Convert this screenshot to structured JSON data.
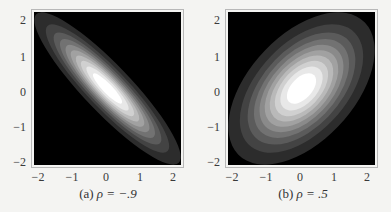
{
  "chart_data": [
    {
      "type": "heatmap",
      "subtype": "filled-contour",
      "title": "",
      "caption": "(a) ρ = −.9",
      "caption_label": "(a)",
      "caption_expr": "ρ = −.9",
      "distribution": "bivariate standard normal",
      "rho": -0.9,
      "xlabel": "",
      "ylabel": "",
      "xlim": [
        -2.2,
        2.2
      ],
      "ylim": [
        -2.2,
        2.2
      ],
      "xticks": [
        -2,
        -1,
        0,
        1,
        2
      ],
      "yticks": [
        -2,
        -1,
        0,
        1,
        2
      ],
      "xtick_labels": [
        "−2",
        "−1",
        "0",
        "1",
        "2"
      ],
      "ytick_labels": [
        "2",
        "1",
        "0",
        "−1",
        "−2"
      ],
      "contour_levels": 10,
      "colormap": "grayscale (black = low density, white = peak)",
      "grid": false,
      "legend": "none"
    },
    {
      "type": "heatmap",
      "subtype": "filled-contour",
      "title": "",
      "caption": "(b) ρ = .5",
      "caption_label": "(b)",
      "caption_expr": "ρ = .5",
      "distribution": "bivariate standard normal",
      "rho": 0.5,
      "xlabel": "",
      "ylabel": "",
      "xlim": [
        -2.2,
        2.2
      ],
      "ylim": [
        -2.2,
        2.2
      ],
      "xticks": [
        -2,
        -1,
        0,
        1,
        2
      ],
      "yticks": [
        -2,
        -1,
        0,
        1,
        2
      ],
      "xtick_labels": [
        "−2",
        "−1",
        "0",
        "1",
        "2"
      ],
      "ytick_labels": [
        "2",
        "1",
        "0",
        "−1",
        "−2"
      ],
      "contour_levels": 10,
      "colormap": "grayscale (black = low density, white = peak)",
      "grid": false,
      "legend": "none"
    }
  ],
  "panels": [
    {
      "caption_label": "(a)",
      "caption_expr": "ρ = −.9",
      "rho": -0.9,
      "xtick_labels": [
        "−2",
        "−1",
        "0",
        "1",
        "2"
      ],
      "ytick_labels": [
        "2",
        "1",
        "0",
        "−1",
        "−2"
      ]
    },
    {
      "caption_label": "(b)",
      "caption_expr": "ρ = .5",
      "rho": 0.5,
      "xtick_labels": [
        "−2",
        "−1",
        "0",
        "1",
        "2"
      ],
      "ytick_labels": [
        "2",
        "1",
        "0",
        "−1",
        "−2"
      ]
    }
  ],
  "colors": {
    "background": "#f4f4f2",
    "plot_background": "#000000",
    "frame": "#b8b8b8",
    "peak": "#ffffff"
  }
}
